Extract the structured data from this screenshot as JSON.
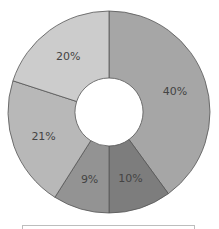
{
  "chart_data": {
    "type": "pie",
    "variant": "donut",
    "title": "",
    "start_angle_deg": 0,
    "direction": "clockwise",
    "slices": [
      {
        "label": "40%",
        "value": 40,
        "color": "#a6a6a6"
      },
      {
        "label": "10%",
        "value": 10,
        "color": "#7d7d7d"
      },
      {
        "label": "9%",
        "value": 9,
        "color": "#939393"
      },
      {
        "label": "21%",
        "value": 21,
        "color": "#b8b8b8"
      },
      {
        "label": "20%",
        "value": 20,
        "color": "#cccccc"
      }
    ],
    "values": [
      40,
      10,
      9,
      21,
      20
    ],
    "categories": [
      "40%",
      "10%",
      "9%",
      "21%",
      "20%"
    ],
    "geometry": {
      "cx": 109,
      "cy": 112,
      "outer_radius": 101,
      "inner_radius": 34
    },
    "stroke_color": "#555555",
    "legend": {
      "position": "bottom",
      "entries": []
    }
  }
}
